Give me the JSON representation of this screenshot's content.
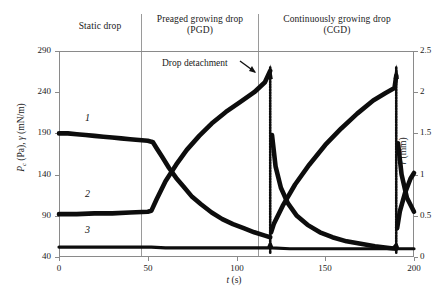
{
  "figure": {
    "phases": [
      {
        "key": "static",
        "label": "Static drop"
      },
      {
        "key": "pgd",
        "label": "Preaged growing drop\n(PGD)"
      },
      {
        "key": "cgd",
        "label": "Continuously growing drop\n(CGD)"
      }
    ],
    "annotation": {
      "text": "Drop detachment",
      "icon": "arrow-down-right-icon"
    }
  },
  "chart_data": {
    "type": "line",
    "title": "",
    "subtitle": "",
    "xlabel": "t (s)",
    "ylabel": "Pc (Pa), γ (mN/m)",
    "ylabel_right": "r (mm)",
    "xlim": [
      0,
      200
    ],
    "ylim": [
      40,
      290
    ],
    "ylim_right": [
      0,
      2.5
    ],
    "xticks": [
      0,
      50,
      100,
      150,
      200
    ],
    "yticks": [
      40,
      90,
      140,
      190,
      240,
      290
    ],
    "yticks_right": [
      0,
      0.5,
      1,
      1.5,
      2,
      2.5
    ],
    "grid": false,
    "legend": "none",
    "annotations": [
      {
        "text": "Drop detachment",
        "x": 119,
        "y": 2.3,
        "axis": "right"
      },
      {
        "text": "Static drop",
        "x": 25,
        "region": "header"
      },
      {
        "text": "Preaged growing drop (PGD)",
        "x": 85,
        "region": "header"
      },
      {
        "text": "Continuously growing drop (CGD)",
        "x": 160,
        "region": "header"
      }
    ],
    "phase_boundaries": [
      52,
      118
    ],
    "detachment_events": [
      119,
      190
    ],
    "series": [
      {
        "name": "1",
        "label": "1",
        "axis": "left",
        "description": "Surface tension gamma (mN/m): flat near 190 during static drop, decays toward 50 after drop growth starts, resets at each detachment",
        "x": [
          0,
          5,
          10,
          15,
          20,
          25,
          30,
          35,
          40,
          45,
          50,
          52,
          53,
          55,
          58,
          62,
          66,
          70,
          75,
          80,
          86,
          92,
          98,
          104,
          110,
          116,
          119,
          120,
          122,
          125,
          129,
          134,
          140,
          147,
          154,
          162,
          170,
          178,
          186,
          190,
          191,
          193,
          196,
          200
        ],
        "y": [
          190,
          190,
          189,
          188,
          187,
          186,
          185,
          184,
          183,
          182,
          181,
          180,
          179,
          172,
          162,
          148,
          136,
          126,
          113,
          104,
          94,
          86,
          80,
          75,
          70,
          66,
          64,
          188,
          150,
          124,
          105,
          90,
          79,
          70,
          64,
          59,
          56,
          53,
          51,
          50,
          178,
          140,
          112,
          95
        ]
      },
      {
        "name": "2",
        "label": "2",
        "axis": "right",
        "description": "Drop radius r (mm): constant ~0.5 in static phase, grows monotonically to ~2.25 then drops sharply at detachment",
        "x": [
          0,
          10,
          20,
          30,
          40,
          50,
          52,
          55,
          60,
          66,
          72,
          79,
          86,
          94,
          102,
          110,
          116,
          119,
          119.5,
          121,
          126,
          133,
          141,
          150,
          159,
          168,
          177,
          184,
          189,
          190,
          190.5,
          192,
          195,
          198,
          200
        ],
        "y": [
          0.52,
          0.52,
          0.53,
          0.53,
          0.54,
          0.55,
          0.56,
          0.7,
          0.92,
          1.12,
          1.3,
          1.47,
          1.62,
          1.76,
          1.88,
          2.0,
          2.12,
          2.26,
          0.3,
          0.4,
          0.62,
          0.88,
          1.12,
          1.36,
          1.56,
          1.74,
          1.9,
          1.99,
          2.05,
          2.2,
          0.35,
          0.55,
          0.78,
          0.95,
          1.02
        ]
      },
      {
        "name": "3",
        "label": "3",
        "axis": "left",
        "description": "Capillary pressure Pc (Pa): nearly flat baseline around 50 Pa with small spikes at detachment events",
        "x": [
          0,
          20,
          40,
          52,
          60,
          70,
          80,
          90,
          100,
          110,
          118,
          119,
          120,
          130,
          140,
          150,
          160,
          170,
          180,
          188,
          190,
          191,
          195,
          200
        ],
        "y": [
          52,
          52,
          52,
          52,
          51,
          51,
          51,
          51,
          51,
          51,
          51,
          56,
          51,
          50,
          50,
          50,
          50,
          50,
          50,
          50,
          55,
          50,
          50,
          50
        ]
      }
    ]
  }
}
